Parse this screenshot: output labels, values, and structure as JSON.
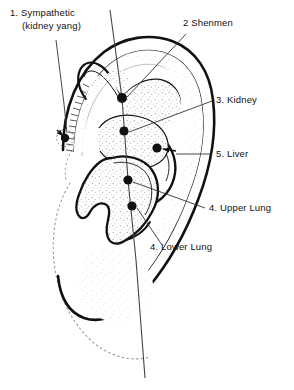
{
  "figure": {
    "title_text": "",
    "type": "auricular-acupuncture-point-diagram",
    "ink_color": "#111111",
    "background_color": "#ffffff",
    "stipple_color": "#8a8a8a"
  },
  "labels": [
    {
      "id": "sympathetic",
      "number": "1.",
      "line1": "1. Sympathetic",
      "line2": "(kidney yang)",
      "x": 10,
      "y": 16
    },
    {
      "id": "shenmen",
      "number": "2",
      "line1": "2 Shenmen",
      "line2": "",
      "x": 183,
      "y": 26
    },
    {
      "id": "kidney",
      "number": "3.",
      "line1": "3. Kidney",
      "line2": "",
      "x": 216,
      "y": 103
    },
    {
      "id": "liver",
      "number": "5.",
      "line1": "5. Liver",
      "line2": "",
      "x": 216,
      "y": 157
    },
    {
      "id": "upper-lung",
      "number": "4.",
      "line1": "4. Upper Lung",
      "line2": "",
      "x": 209,
      "y": 211
    },
    {
      "id": "lower-lung",
      "number": "4.",
      "line1": "4. Lower Lung",
      "line2": "",
      "x": 150,
      "y": 250
    }
  ],
  "points": [
    {
      "id": "sympathetic-point",
      "x": 65,
      "y": 138,
      "r": 4.2,
      "halo": true
    },
    {
      "id": "shenmen-point",
      "x": 122,
      "y": 98,
      "r": 5.0,
      "halo": false
    },
    {
      "id": "kidney-point",
      "x": 124,
      "y": 131,
      "r": 4.6,
      "halo": false
    },
    {
      "id": "liver-point",
      "x": 157,
      "y": 148,
      "r": 4.6,
      "halo": false
    },
    {
      "id": "upper-lung-point",
      "x": 128,
      "y": 180,
      "r": 4.6,
      "halo": false
    },
    {
      "id": "lower-lung-point",
      "x": 132,
      "y": 206,
      "r": 4.6,
      "halo": false
    }
  ]
}
